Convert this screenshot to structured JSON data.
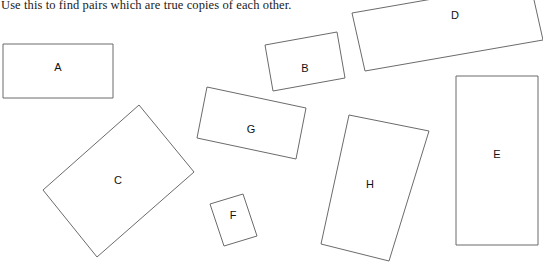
{
  "instruction": "Use this to find pairs which are true copies of each other.",
  "colors": {
    "background": "#ffffff",
    "shape_stroke": "#6b6b6b",
    "label_text": "#111111",
    "instruction_text": "#1a1a1a"
  },
  "canvas": {
    "width": 543,
    "height": 269
  },
  "shapes": [
    {
      "label": "A",
      "points": "3,44 113,44 113,98 3,98",
      "label_x": 58,
      "label_y": 68
    },
    {
      "label": "B",
      "points": "265,45 337,32 345,78 273,91",
      "label_x": 305,
      "label_y": 69
    },
    {
      "label": "D",
      "points": "352,13 530,-18 543,40 365,71",
      "label_x": 455,
      "label_y": 16
    },
    {
      "label": "C",
      "points": "43,190 139,105 194,172 97,257",
      "label_x": 118,
      "label_y": 181
    },
    {
      "label": "G",
      "points": "207,87 306,108 296,159 197,138",
      "label_x": 251,
      "label_y": 130
    },
    {
      "label": "F",
      "points": "210,204 243,194 257,236 224,246",
      "label_x": 233,
      "label_y": 216
    },
    {
      "label": "H",
      "points": "349,115 429,131 389,261 321,244",
      "label_x": 370,
      "label_y": 185
    },
    {
      "label": "E",
      "points": "456,76 538,76 538,245 456,245",
      "label_x": 497,
      "label_y": 155
    }
  ]
}
